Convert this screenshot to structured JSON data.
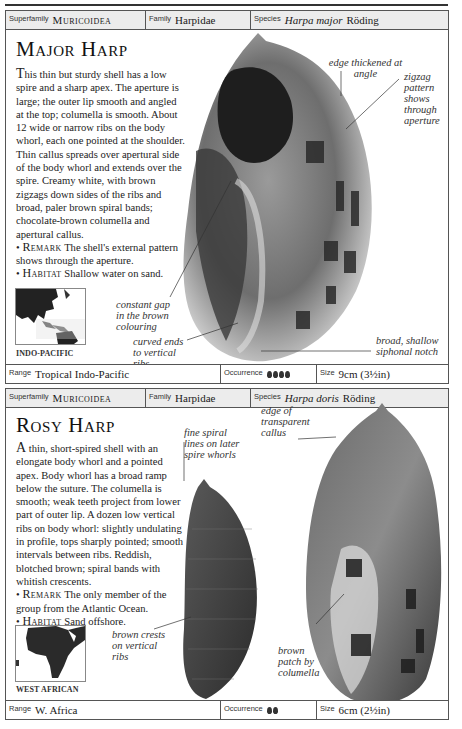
{
  "entries": [
    {
      "header": {
        "superfamily_label": "Superfamily",
        "superfamily": "Muricoidea",
        "family_label": "Family",
        "family": "Harpidae",
        "species_label": "Species",
        "species_name": "Harpa major",
        "species_author": "Röding"
      },
      "title": "Major Harp",
      "description_cap": "T",
      "description": "his thin but sturdy shell has a low spire and a sharp apex. The aperture is large; the outer lip smooth and angled at the top; columella is smooth. About 12 wide or narrow ribs on the body whorl, each one pointed at the shoulder. Thin callus spreads over apertural side of the body whorl and extends over the spire. Creamy white, with brown zigzags down sides of the ribs and broad, paler brown spiral bands; chocolate-brown columella and apertural callus.",
      "remark_label": "Remark",
      "remark": "The shell's external pattern shows through the aperture.",
      "habitat_label": "Habitat",
      "habitat": "Shallow water on sand.",
      "map_label": "INDO-PACIFIC",
      "annotations": [
        "edge thickened at angle",
        "zigzag pattern shows through aperture",
        "constant gap in the brown colouring",
        "curved ends to vertical ribs",
        "broad, shallow siphonal notch"
      ],
      "footer": {
        "range_label": "Range",
        "range": "Tropical Indo-Pacific",
        "occurrence_label": "Occurrence",
        "occurrence_level": 4,
        "size_label": "Size",
        "size": "9cm (3½in)"
      }
    },
    {
      "header": {
        "superfamily_label": "Superfamily",
        "superfamily": "Muricoidea",
        "family_label": "Family",
        "family": "Harpidae",
        "species_label": "Species",
        "species_name": "Harpa doris",
        "species_author": "Röding"
      },
      "title": "Rosy Harp",
      "description_cap": "A",
      "description": " thin, short-spired shell with an elongate body whorl and a pointed apex. Body whorl has a broad ramp below the suture. The columella is smooth; weak teeth project from lower part of outer lip. A dozen low vertical ribs on body whorl: slightly undulating in profile, tops sharply pointed; smooth intervals between ribs. Reddish, blotched brown; spiral bands with whitish crescents.",
      "remark_label": "Remark",
      "remark": "The only member of the group from the Atlantic Ocean.",
      "habitat_label": "Habitat",
      "habitat": "Sand offshore.",
      "map_label": "WEST AFRICAN",
      "annotations": [
        "fine spiral lines on later spire whorls",
        "edge of transparent callus",
        "brown crests on vertical ribs",
        "brown patch by columella"
      ],
      "footer": {
        "range_label": "Range",
        "range": "W. Africa",
        "occurrence_label": "Occurrence",
        "occurrence_level": 2,
        "size_label": "Size",
        "size": "6cm (2½in)"
      }
    }
  ]
}
